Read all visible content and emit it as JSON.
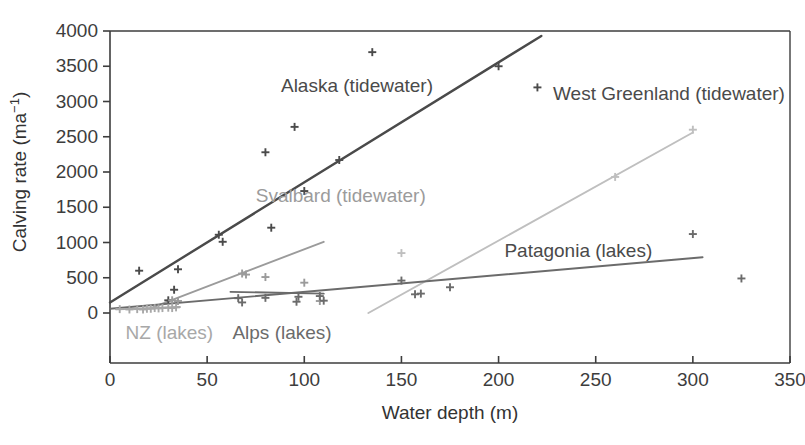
{
  "chart_data": {
    "type": "scatter",
    "title": "",
    "xlabel": "Water depth (m)",
    "ylabel": "Calving rate (ma⁻¹)",
    "ylabel_base": "Calving rate (ma",
    "ylabel_exponent": "−1",
    "ylabel_close": ")",
    "xlim": [
      0,
      350
    ],
    "ylim": [
      0,
      4000
    ],
    "xticks": [
      0,
      50,
      100,
      150,
      200,
      250,
      300,
      350
    ],
    "xticklabels": [
      "0",
      "50",
      "100",
      "150",
      "200",
      "250",
      "300",
      "350"
    ],
    "yticks": [
      0,
      500,
      1000,
      1500,
      2000,
      2500,
      3000,
      3500,
      4000
    ],
    "yticklabels": [
      "0",
      "500",
      "1000",
      "1500",
      "2000",
      "2500",
      "3000",
      "3500",
      "4000"
    ],
    "grid": false,
    "legend_position": "inline-annotations",
    "marker": "plus",
    "series": [
      {
        "name": "Alaska (tidewater)",
        "label": "Alaska (tidewater)",
        "color": "#4a4a4a",
        "label_color": "#4a4a4a",
        "label_x": 88,
        "label_y": 3140,
        "points": [
          [
            15,
            600
          ],
          [
            30,
            180
          ],
          [
            33,
            330
          ],
          [
            35,
            620
          ],
          [
            56,
            1110
          ],
          [
            58,
            1010
          ],
          [
            80,
            2280
          ],
          [
            83,
            1210
          ],
          [
            95,
            2640
          ],
          [
            100,
            1730
          ],
          [
            118,
            2170
          ],
          [
            135,
            3700
          ],
          [
            200,
            3500
          ],
          [
            220,
            3200
          ]
        ],
        "fit": {
          "x1": 0,
          "y1": 150,
          "x2": 222,
          "y2": 3930
        }
      },
      {
        "name": "Svalbard (tidewater)",
        "label": "Svalbard (tidewater)",
        "color": "#9b9b9b",
        "label_color": "#9b9b9b",
        "label_x": 75,
        "label_y": 1570,
        "points": [
          [
            32,
            180
          ],
          [
            35,
            170
          ],
          [
            68,
            560
          ],
          [
            70,
            545
          ],
          [
            80,
            510
          ],
          [
            100,
            430
          ],
          [
            108,
            170
          ]
        ],
        "fit": {
          "x1": 22,
          "y1": 80,
          "x2": 110,
          "y2": 1010
        }
      },
      {
        "name": "West Greenland (tidewater)",
        "label": "West Greenland (tidewater)",
        "color": "#bfbfbf",
        "label_color": "#4a4a4a",
        "label_x": 228,
        "label_y": 3020,
        "points": [
          [
            150,
            850
          ],
          [
            260,
            1930
          ],
          [
            300,
            2600
          ]
        ],
        "fit": {
          "x1": 133,
          "y1": 0,
          "x2": 300,
          "y2": 2560
        }
      },
      {
        "name": "Patagonia (lakes)",
        "label": "Patagonia (lakes)",
        "color": "#6b6b6b",
        "label_color": "#4a4a4a",
        "label_x": 203,
        "label_y": 790,
        "points": [
          [
            68,
            150
          ],
          [
            96,
            160
          ],
          [
            110,
            175
          ],
          [
            150,
            460
          ],
          [
            157,
            265
          ],
          [
            160,
            275
          ],
          [
            175,
            365
          ],
          [
            300,
            1120
          ],
          [
            325,
            490
          ]
        ],
        "fit": {
          "x1": 0,
          "y1": 60,
          "x2": 305,
          "y2": 790
        }
      },
      {
        "name": "Alps (lakes)",
        "label": "Alps (lakes)",
        "color": "#6b6b6b",
        "label_color": "#6b6b6b",
        "label_x": 63,
        "label_y": -370,
        "points": [
          [
            66,
            210
          ],
          [
            80,
            215
          ],
          [
            97,
            230
          ],
          [
            108,
            240
          ]
        ],
        "fit": {
          "x1": 62,
          "y1": 300,
          "x2": 110,
          "y2": 275
        }
      },
      {
        "name": "NZ (lakes)",
        "label": "NZ (lakes)",
        "color": "#a8a8a8",
        "label_color": "#a8a8a8",
        "label_x": 8,
        "label_y": -370,
        "points": [
          [
            5,
            55
          ],
          [
            10,
            50
          ],
          [
            14,
            55
          ],
          [
            17,
            50
          ],
          [
            19,
            60
          ],
          [
            21,
            60
          ],
          [
            23,
            70
          ],
          [
            25,
            65
          ],
          [
            27,
            70
          ],
          [
            30,
            75
          ],
          [
            32,
            70
          ],
          [
            34,
            80
          ]
        ],
        "fit": {
          "x1": 3,
          "y1": 52,
          "x2": 36,
          "y2": 85
        }
      }
    ]
  },
  "axis": {
    "x_title": "Water depth (m)",
    "y_title_base": "Calving rate (ma",
    "y_title_exp": "−1",
    "y_title_close": ")"
  },
  "colors": {
    "axis": "#3d3d3d",
    "background": "#ffffff",
    "alaska": "#4a4a4a",
    "svalbard": "#9b9b9b",
    "greenland": "#bfbfbf",
    "patagonia": "#6b6b6b",
    "alps": "#6b6b6b",
    "nz": "#a8a8a8"
  }
}
